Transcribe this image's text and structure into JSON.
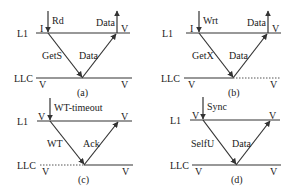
{
  "diagram": {
    "levels": {
      "top": "L1",
      "bottom": "LLC"
    },
    "panels": [
      {
        "caption": "(a)",
        "trigger": "Rd",
        "request": "GetS",
        "response": "Data",
        "return": "Data",
        "l1_state_before": "I",
        "l1_state_after": "V",
        "llc_state_before": "V",
        "llc_state_after": "V",
        "llc_line": "solid"
      },
      {
        "caption": "(b)",
        "trigger": "Wrt",
        "request": "GetX",
        "response": "Data",
        "return": "Data",
        "l1_state_before": "I",
        "l1_state_after": "V",
        "llc_state_before": "V",
        "llc_state_after": "V",
        "llc_line": "solid-then-dotted"
      },
      {
        "caption": "(c)",
        "trigger": "WT-timeout",
        "request": "WT",
        "response": "Ack",
        "l1_state_before": "V",
        "l1_state_after": "V",
        "llc_state_before": "V",
        "llc_state_after": "V",
        "llc_line": "dotted-then-solid"
      },
      {
        "caption": "(d)",
        "trigger": "Sync",
        "request": "SelfU",
        "response": "Data",
        "l1_state_before": "V",
        "l1_state_after": "V",
        "llc_state_before": "V",
        "llc_state_after": "V",
        "llc_line": "solid"
      }
    ]
  }
}
